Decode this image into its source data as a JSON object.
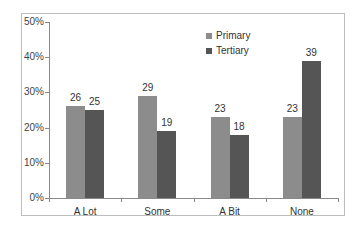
{
  "chart_data": {
    "type": "bar",
    "title": "",
    "xlabel": "",
    "ylabel": "",
    "categories": [
      "A Lot",
      "Some",
      "A Bit",
      "None"
    ],
    "series": [
      {
        "name": "Primary",
        "values": [
          26,
          29,
          23,
          23
        ],
        "color": "#8c8c8c"
      },
      {
        "name": "Tertiary",
        "values": [
          25,
          19,
          18,
          39
        ],
        "color": "#555555"
      }
    ],
    "ylim": [
      0,
      50
    ],
    "yticks": [
      "0%",
      "10%",
      "20%",
      "30%",
      "40%",
      "50%"
    ],
    "grid": false,
    "legend_position": "top-right inside plot",
    "data_labels": true
  }
}
